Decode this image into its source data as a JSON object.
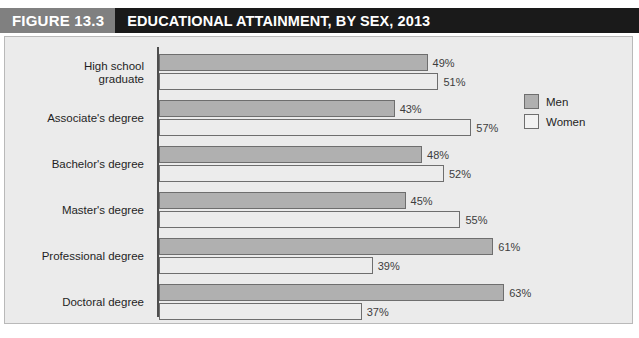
{
  "figure": {
    "number_label": "FIGURE 13.3",
    "title": "EDUCATIONAL ATTAINMENT, BY SEX, 2013"
  },
  "legend": {
    "items": [
      {
        "label": "Men",
        "color": "#b0b0b0"
      },
      {
        "label": "Women",
        "color": "#f2f2f2"
      }
    ]
  },
  "chart_data": {
    "type": "bar",
    "orientation": "horizontal",
    "title": "EDUCATIONAL ATTAINMENT, BY SEX, 2013",
    "xlabel": "",
    "ylabel": "",
    "xlim": [
      0,
      100
    ],
    "grid": false,
    "legend_position": "top-right",
    "value_suffix": "%",
    "categories": [
      "High school graduate",
      "Associate's degree",
      "Bachelor's degree",
      "Master's degree",
      "Professional degree",
      "Doctoral degree"
    ],
    "category_lines": [
      [
        "High school",
        "graduate"
      ],
      [
        "Associate's degree"
      ],
      [
        "Bachelor's degree"
      ],
      [
        "Master's degree"
      ],
      [
        "Professional degree"
      ],
      [
        "Doctoral degree"
      ]
    ],
    "series": [
      {
        "name": "Men",
        "color": "#b0b0b0",
        "values": [
          49,
          43,
          48,
          45,
          61,
          63
        ],
        "labels": [
          "49%",
          "43%",
          "48%",
          "45%",
          "61%",
          "63%"
        ]
      },
      {
        "name": "Women",
        "color": "#ececec",
        "values": [
          51,
          57,
          52,
          55,
          39,
          37
        ],
        "labels": [
          "51%",
          "57%",
          "52%",
          "55%",
          "39%",
          "37%"
        ]
      }
    ]
  }
}
